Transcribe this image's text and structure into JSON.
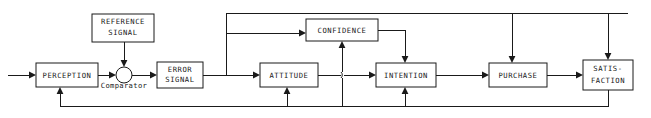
{
  "diagram": {
    "type": "block-flow-diagram",
    "canvas": {
      "width": 651,
      "height": 118
    },
    "stroke_color": "#1a1a1a",
    "fill_color": "#ffffff",
    "nodes": [
      {
        "id": "perception",
        "label_lines": [
          "PERCEPTION"
        ],
        "shape": "rect",
        "x": 36,
        "y": 63,
        "w": 62,
        "h": 24
      },
      {
        "id": "reference-signal",
        "label_lines": [
          "REFERENCE",
          "SIGNAL"
        ],
        "shape": "rect",
        "x": 92,
        "y": 14,
        "w": 62,
        "h": 28
      },
      {
        "id": "comparator",
        "label_lines": [],
        "aux_label": "Comparator",
        "shape": "circle",
        "cx": 124,
        "cy": 75,
        "r": 8
      },
      {
        "id": "error-signal",
        "label_lines": [
          "ERROR",
          "SIGNAL"
        ],
        "shape": "rect",
        "x": 157,
        "y": 62,
        "w": 46,
        "h": 26
      },
      {
        "id": "attitude",
        "label_lines": [
          "ATTITUDE"
        ],
        "shape": "rect",
        "x": 260,
        "y": 63,
        "w": 58,
        "h": 24
      },
      {
        "id": "confidence",
        "label_lines": [
          "CONFIDENCE"
        ],
        "shape": "rect",
        "x": 306,
        "y": 19,
        "w": 72,
        "h": 22
      },
      {
        "id": "intention",
        "label_lines": [
          "INTENTION"
        ],
        "shape": "rect",
        "x": 376,
        "y": 63,
        "w": 60,
        "h": 24
      },
      {
        "id": "purchase",
        "label_lines": [
          "PURCHASE"
        ],
        "shape": "rect",
        "x": 489,
        "y": 63,
        "w": 58,
        "h": 24
      },
      {
        "id": "satisfaction",
        "label_lines": [
          "SATIS-",
          "FACTION"
        ],
        "shape": "rect",
        "x": 583,
        "y": 60,
        "w": 50,
        "h": 30
      }
    ],
    "connections": [
      {
        "id": "input-to-perception",
        "from": "external-input",
        "to": "perception"
      },
      {
        "id": "reference-to-comparator",
        "from": "reference-signal",
        "to": "comparator"
      },
      {
        "id": "perception-to-comparator",
        "from": "perception",
        "to": "comparator"
      },
      {
        "id": "comparator-to-error",
        "from": "comparator",
        "to": "error-signal"
      },
      {
        "id": "error-to-attitude",
        "from": "error-signal",
        "to": "attitude"
      },
      {
        "id": "error-to-confidence",
        "from": "error-signal",
        "to": "confidence"
      },
      {
        "id": "attitude-to-intention",
        "from": "attitude",
        "to": "intention"
      },
      {
        "id": "confidence-to-intention",
        "from": "confidence",
        "to": "intention"
      },
      {
        "id": "intention-to-purchase",
        "from": "intention",
        "to": "purchase"
      },
      {
        "id": "purchase-to-satisfaction",
        "from": "purchase",
        "to": "satisfaction"
      },
      {
        "id": "top-bus-to-purchase",
        "from": "top-bus",
        "to": "purchase"
      },
      {
        "id": "top-bus-to-satisfaction",
        "from": "top-bus",
        "to": "satisfaction"
      },
      {
        "id": "satisfaction-feedback-to-intention",
        "from": "satisfaction",
        "to": "intention"
      },
      {
        "id": "satisfaction-feedback-to-attitude",
        "from": "satisfaction",
        "to": "attitude"
      },
      {
        "id": "satisfaction-feedback-to-perception",
        "from": "satisfaction",
        "to": "perception"
      },
      {
        "id": "feedback-to-confidence",
        "from": "bottom-bus",
        "to": "confidence"
      }
    ]
  },
  "labels": {
    "perception": "PERCEPTION",
    "reference_signal_line1": "REFERENCE",
    "reference_signal_line2": "SIGNAL",
    "comparator": "Comparator",
    "error_signal_line1": "ERROR",
    "error_signal_line2": "SIGNAL",
    "attitude": "ATTITUDE",
    "confidence": "CONFIDENCE",
    "intention": "INTENTION",
    "purchase": "PURCHASE",
    "satisfaction_line1": "SATIS-",
    "satisfaction_line2": "FACTION"
  }
}
